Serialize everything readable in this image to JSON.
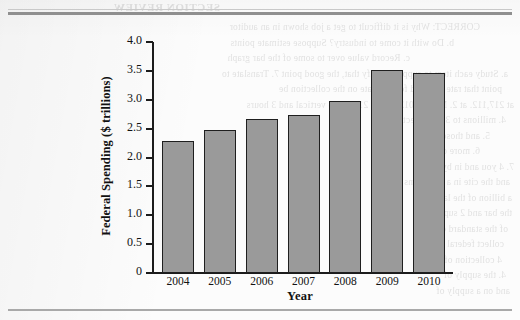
{
  "page": {
    "ghost_header": "SECTION REVIEW",
    "ghost_lines": [
      "CORRECT: Why is it difficult to get a job shown in an auditor",
      "b. Do with it come to industry? Suppose estimate points",
      "c. Record value over to some of the bar graph",
      "a. Study each item to supply. Clarify that, the good point 7. Translate to",
      "point that rate 4. R and for estimate on the collection be",
      "at 217,112. at 2. March 2012; to 3.5 21 3.1 the vertical and 3 hours",
      "4. millions to 3, to collection in",
      "5. and those the",
      "6. more of the",
      "7. 4 you and in by the",
      "and the cite in a 3 sections of",
      "a billion of the later and",
      "the bar and 2 supply and",
      "of the standard of the",
      "collect federal and",
      "4 collection of",
      "4. the supply of",
      "and on a supply of"
    ]
  },
  "chart_data": {
    "type": "bar",
    "title": "",
    "xlabel": "Year",
    "ylabel": "Federal Spending ($ trillions)",
    "categories": [
      "2004",
      "2005",
      "2006",
      "2007",
      "2008",
      "2009",
      "2010"
    ],
    "values": [
      2.29,
      2.47,
      2.66,
      2.73,
      2.98,
      3.52,
      3.46
    ],
    "ylim": [
      0,
      4.0
    ],
    "yticks": [
      "0",
      "0.5",
      "1.0",
      "1.5",
      "2.0",
      "2.5",
      "3.0",
      "3.5",
      "4.0"
    ],
    "ytick_values": [
      0,
      0.5,
      1.0,
      1.5,
      2.0,
      2.5,
      3.0,
      3.5,
      4.0
    ],
    "grid": false,
    "legend": null,
    "bar_color": "#9a9a9a",
    "bar_edge_color": "#1f1f1f"
  }
}
